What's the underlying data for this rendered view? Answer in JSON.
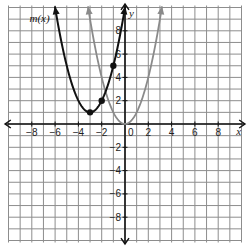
{
  "chart_data": {
    "type": "line",
    "title": "",
    "xlabel": "x",
    "ylabel": "y",
    "xlim": [
      -10,
      10
    ],
    "ylim": [
      -10,
      10
    ],
    "grid": true,
    "x_tick_labels": [
      "-8",
      "-6",
      "-4",
      "-2",
      "0",
      "2",
      "4",
      "6",
      "8"
    ],
    "y_tick_labels": [
      "8",
      "6",
      "4",
      "2",
      "-2",
      "-4",
      "-6",
      "-8"
    ],
    "origin_label": "0",
    "series": [
      {
        "name": "m(x)",
        "label": "m(x)",
        "color": "#111111",
        "equation": "(x+3)^2 + 1",
        "vertex": [
          -3,
          1
        ],
        "marked_points": [
          [
            -3,
            1
          ],
          [
            -2,
            2
          ],
          [
            -1,
            5
          ]
        ]
      },
      {
        "name": "parent",
        "label": "",
        "color": "#8a8a8a",
        "equation": "x^2",
        "vertex": [
          0,
          0
        ],
        "marked_points": []
      }
    ]
  }
}
